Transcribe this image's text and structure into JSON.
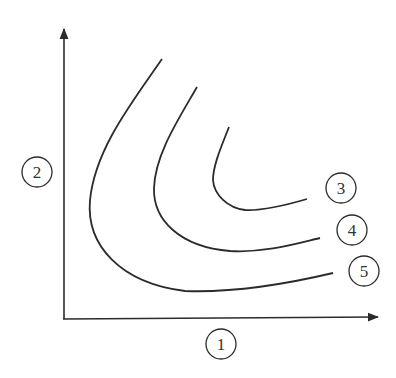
{
  "diagram": {
    "type": "indifference-curves",
    "colors": {
      "line": "#2b2b2b",
      "background": "#ffffff"
    },
    "axes": {
      "x_label": "1",
      "y_label": "2"
    },
    "curves": [
      {
        "id": "curve-3",
        "label": "3",
        "position": "innermost"
      },
      {
        "id": "curve-4",
        "label": "4",
        "position": "middle"
      },
      {
        "id": "curve-5",
        "label": "5",
        "position": "outermost"
      }
    ]
  }
}
